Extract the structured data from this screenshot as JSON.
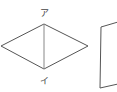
{
  "diagram": {
    "rhombus": {
      "vertices": {
        "top": [
          44,
          24
        ],
        "right": [
          88,
          46
        ],
        "bottom": [
          44,
          69
        ],
        "left": [
          1,
          46
        ]
      },
      "diagonal": "vertical",
      "labels": {
        "top": "ア",
        "bottom": "イ"
      }
    },
    "partial_shape": {
      "type": "quadrilateral (cropped)",
      "visible_edges": "top, left, bottom"
    },
    "colors": {
      "edge": "#555555",
      "diagonal": "#888888",
      "label": "#444444"
    }
  }
}
